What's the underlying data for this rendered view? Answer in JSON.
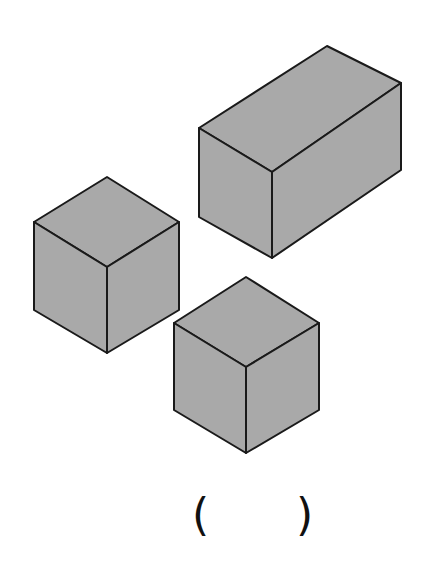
{
  "figure": {
    "fill_color": "#a9a9a9",
    "stroke_color": "#1a1a1a",
    "shapes": [
      {
        "name": "rectangular-prism",
        "label": "cuboid",
        "faces": {
          "top": "199,128 327,46 401,83 272,172",
          "front": "199,128 272,172 272,258 199,217",
          "side": "272,172 401,83 401,170 272,258"
        }
      },
      {
        "name": "cube-left",
        "label": "cube",
        "faces": {
          "top": "34,222 107,177 179,222 107,267",
          "front": "34,222 107,267 107,353 34,310",
          "side": "107,267 179,222 179,310 107,353"
        }
      },
      {
        "name": "cube-bottom",
        "label": "cube",
        "faces": {
          "top": "174,323 246,277 319,323 246,367",
          "front": "174,323 246,367 246,453 174,410",
          "side": "246,367 319,323 319,410 246,453"
        }
      }
    ]
  },
  "answer_blank": {
    "open": "(",
    "close": ")",
    "value": ""
  }
}
